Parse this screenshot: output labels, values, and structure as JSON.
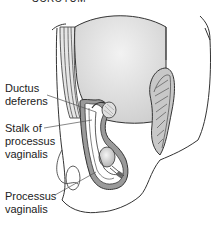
{
  "figure": {
    "title": "SCROTUM",
    "labels": {
      "ductus_deferens": [
        "Ductus",
        "deferens"
      ],
      "stalk": [
        "Stalk of",
        "processus",
        "vaginalis"
      ],
      "processus_vaginalis": [
        "Processus",
        "vaginalis"
      ]
    },
    "colors": {
      "outline": "#333333",
      "body_fill": "#ffffff",
      "cavity_fill": "#dcdcdc",
      "wall_fill": "#9a9a9a",
      "leader_line": "#555555"
    }
  }
}
